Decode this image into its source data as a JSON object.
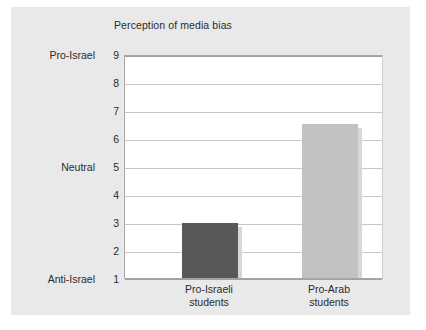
{
  "chart_data": {
    "type": "bar",
    "title": "Perception of media bias",
    "xlabel": "",
    "ylabel": "",
    "categories": [
      "Pro-Israeli students",
      "Pro-Arab students"
    ],
    "category_lines": [
      [
        "Pro-Israeli",
        "students"
      ],
      [
        "Pro-Arab",
        "students"
      ]
    ],
    "values": [
      2.95,
      6.5
    ],
    "ylim": [
      1,
      9
    ],
    "yticks": [
      1,
      2,
      3,
      4,
      5,
      6,
      7,
      8,
      9
    ],
    "ytick_labels": [
      "1",
      "2",
      "3",
      "4",
      "5",
      "6",
      "7",
      "8",
      "9"
    ],
    "y_category_labels": [
      {
        "value": 9,
        "label": "Pro-Israel"
      },
      {
        "value": 5,
        "label": "Neutral"
      },
      {
        "value": 1,
        "label": "Anti-Israel"
      }
    ],
    "grid": true,
    "legend": "none",
    "bar_colors": [
      "#585859",
      "#c2c2c2"
    ],
    "plot_background": "#ffffff",
    "panel_background": "#e9e9e9",
    "gridline_color": "#c6c6c6",
    "axis_color": "#a0a0a0",
    "text_color": "#2b2b2b"
  }
}
